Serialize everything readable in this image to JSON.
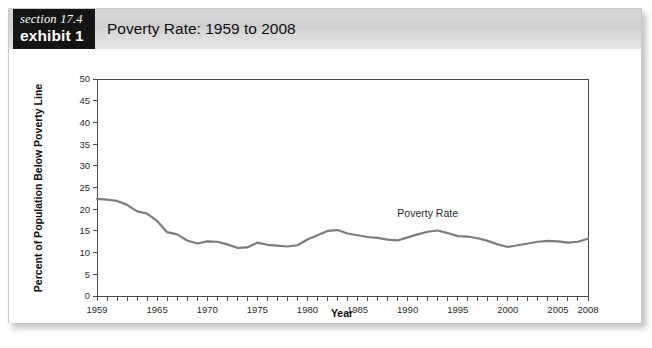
{
  "exhibit": {
    "badge_section": "section 17.4",
    "badge_exhibit": "exhibit 1",
    "title": "Poverty Rate: 1959 to 2008"
  },
  "colors": {
    "badge_background": "#141414",
    "header_background": "#d4d4d4",
    "series_line": "#7d7d7d",
    "axis": "#4a4a4a",
    "card_background": "#ffffff"
  },
  "chart_data": {
    "type": "line",
    "title": "Poverty Rate: 1959 to 2008",
    "xlabel": "Year",
    "ylabel": "Percent of Population Below Poverty Line",
    "xlim": [
      1959,
      2008
    ],
    "ylim": [
      0,
      50
    ],
    "grid": false,
    "legend": "none",
    "annotations": [
      {
        "text": "Poverty Rate",
        "x": 1992,
        "y": 18.2
      }
    ],
    "x_tick_labels": [
      "1959",
      "1965",
      "1970",
      "1975",
      "1980",
      "1985",
      "1990",
      "1995",
      "2000",
      "2005",
      "2008"
    ],
    "x_tick_values": [
      1959,
      1965,
      1970,
      1975,
      1980,
      1985,
      1990,
      1995,
      2000,
      2005,
      2008
    ],
    "x_minor_tick_step": 1,
    "y_tick_labels": [
      "0",
      "5",
      "10",
      "15",
      "20",
      "25",
      "30",
      "35",
      "40",
      "45",
      "50"
    ],
    "y_tick_values": [
      0,
      5,
      10,
      15,
      20,
      25,
      30,
      35,
      40,
      45,
      50
    ],
    "series": [
      {
        "name": "Poverty Rate",
        "color": "#7d7d7d",
        "x": [
          1959,
          1960,
          1961,
          1962,
          1963,
          1964,
          1965,
          1966,
          1967,
          1968,
          1969,
          1970,
          1971,
          1972,
          1973,
          1974,
          1975,
          1976,
          1977,
          1978,
          1979,
          1980,
          1981,
          1982,
          1983,
          1984,
          1985,
          1986,
          1987,
          1988,
          1989,
          1990,
          1991,
          1992,
          1993,
          1994,
          1995,
          1996,
          1997,
          1998,
          1999,
          2000,
          2001,
          2002,
          2003,
          2004,
          2005,
          2006,
          2007,
          2008
        ],
        "values": [
          22.4,
          22.2,
          21.9,
          21.0,
          19.5,
          19.0,
          17.3,
          14.7,
          14.2,
          12.8,
          12.1,
          12.6,
          12.5,
          11.9,
          11.1,
          11.2,
          12.3,
          11.8,
          11.6,
          11.4,
          11.7,
          13.0,
          14.0,
          15.0,
          15.2,
          14.4,
          14.0,
          13.6,
          13.4,
          13.0,
          12.8,
          13.5,
          14.2,
          14.8,
          15.1,
          14.5,
          13.8,
          13.7,
          13.3,
          12.7,
          11.9,
          11.3,
          11.7,
          12.1,
          12.5,
          12.7,
          12.6,
          12.3,
          12.5,
          13.2
        ]
      }
    ]
  }
}
